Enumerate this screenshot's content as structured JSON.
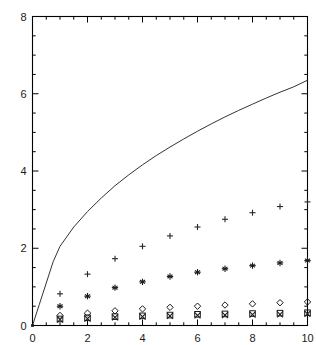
{
  "chart_data": {
    "type": "scatter",
    "title": "",
    "subtitle": "",
    "xlabel": "",
    "ylabel": "",
    "xlim": [
      0,
      10
    ],
    "ylim": [
      0,
      8
    ],
    "grid": false,
    "legend": "none",
    "x_ticks": [
      0,
      2,
      4,
      6,
      8,
      10
    ],
    "x_tick_labels": [
      "0",
      "2",
      "4",
      "6",
      "8",
      "10"
    ],
    "x_minor_step": 0.5,
    "y_ticks": [
      0,
      2,
      4,
      6,
      8
    ],
    "y_tick_labels": [
      "0",
      "2",
      "4",
      "6",
      "8"
    ],
    "y_minor_step": 0.5,
    "axis_color": "#000000",
    "frame": "box",
    "tick_direction": "in",
    "x": [
      1,
      2,
      3,
      4,
      5,
      6,
      7,
      8,
      9,
      10
    ],
    "series": [
      {
        "name": "curve",
        "type": "line",
        "marker": "none",
        "color": "#333333",
        "x": [
          0,
          0.25,
          0.5,
          0.75,
          1.0,
          1.5,
          2.0,
          2.5,
          3.0,
          3.5,
          4.0,
          4.5,
          5.0,
          5.5,
          6.0,
          6.5,
          7.0,
          7.5,
          8.0,
          8.5,
          9.0,
          9.5,
          10.0
        ],
        "values": [
          0,
          0.55,
          1.1,
          1.65,
          2.05,
          2.55,
          2.95,
          3.3,
          3.62,
          3.9,
          4.16,
          4.4,
          4.62,
          4.83,
          5.03,
          5.22,
          5.4,
          5.57,
          5.73,
          5.89,
          6.04,
          6.18,
          6.35
        ]
      },
      {
        "name": "plus-series",
        "type": "scatter",
        "marker": "plus",
        "color": "#262626",
        "values": [
          0.82,
          1.33,
          1.73,
          2.05,
          2.32,
          2.55,
          2.75,
          2.92,
          3.08,
          3.2
        ]
      },
      {
        "name": "star-series",
        "type": "scatter",
        "marker": "star",
        "color": "#1a1a1a",
        "values": [
          0.5,
          0.76,
          0.98,
          1.13,
          1.27,
          1.38,
          1.47,
          1.55,
          1.62,
          1.68
        ]
      },
      {
        "name": "diamond-series",
        "type": "scatter",
        "marker": "diamond",
        "color": "#1a1a1a",
        "values": [
          0.26,
          0.32,
          0.38,
          0.43,
          0.47,
          0.5,
          0.53,
          0.56,
          0.59,
          0.61
        ]
      },
      {
        "name": "square-series",
        "type": "scatter",
        "marker": "square",
        "color": "#1a1a1a",
        "values": [
          0.17,
          0.2,
          0.23,
          0.25,
          0.27,
          0.29,
          0.3,
          0.31,
          0.32,
          0.33
        ]
      },
      {
        "name": "cross-series",
        "type": "scatter",
        "marker": "cross",
        "color": "#1a1a1a",
        "values": [
          0.15,
          0.18,
          0.21,
          0.23,
          0.25,
          0.26,
          0.27,
          0.28,
          0.29,
          0.3
        ]
      }
    ]
  }
}
